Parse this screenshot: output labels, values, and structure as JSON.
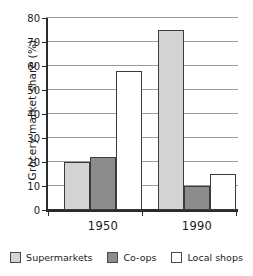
{
  "chart_data": {
    "type": "bar",
    "title": "",
    "xlabel": "",
    "ylabel": "Grocery market share (%)",
    "categories": [
      "1950",
      "1990"
    ],
    "ylim": [
      0,
      80
    ],
    "yticks": [
      0,
      10,
      20,
      30,
      40,
      50,
      60,
      70,
      80
    ],
    "ytick_labels": [
      "0",
      "10",
      "20",
      "30",
      "40",
      "50",
      "60",
      "70",
      "80"
    ],
    "grid": true,
    "legend_position": "bottom",
    "series": [
      {
        "name": "Supermarkets",
        "color": "#d4d4d4",
        "values": [
          20,
          75
        ]
      },
      {
        "name": "Co-ops",
        "color": "#8c8c8c",
        "values": [
          22,
          10
        ]
      },
      {
        "name": "Local shops",
        "color": "#ffffff",
        "values": [
          58,
          15
        ]
      }
    ]
  },
  "colors": {
    "axis": "#2b2b2b",
    "grid": "#9a9a9a",
    "bar_border": "#3a3a3a",
    "text": "#1a1a1a",
    "background": "#ffffff"
  }
}
